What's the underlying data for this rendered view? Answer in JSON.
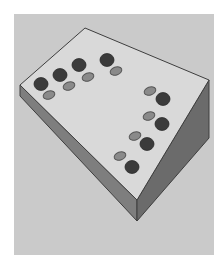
{
  "figure": {
    "colors": {
      "page_background": "#ffffff",
      "panel_background": "#cacaca",
      "top_face": "#d9d9d9",
      "left_face": "#7e7e7e",
      "right_face": "#6b6b6b",
      "edge_line": "#3e3e3e",
      "dark_disc": "#3b3b3b",
      "light_disc": "#8a8a8a",
      "light_disc_outline": "#555555"
    },
    "slab": {
      "top_face_points": "85,28 209,80 137,200 20,85",
      "left_face_points": "20,85 137,200 137,221 20,96",
      "right_face_points": "137,200 209,80 209,138 137,221"
    },
    "disc_pairs": [
      {
        "group": "top-row",
        "dark": {
          "cx": 41,
          "cy": 84,
          "r": 7
        },
        "light": {
          "cx": 49,
          "cy": 95,
          "rx": 6,
          "ry": 4
        }
      },
      {
        "group": "top-row",
        "dark": {
          "cx": 60,
          "cy": 75,
          "r": 7
        },
        "light": {
          "cx": 69,
          "cy": 86,
          "rx": 6,
          "ry": 4
        }
      },
      {
        "group": "top-row",
        "dark": {
          "cx": 79,
          "cy": 65,
          "r": 7
        },
        "light": {
          "cx": 88,
          "cy": 77,
          "rx": 6,
          "ry": 4
        }
      },
      {
        "group": "top-row",
        "dark": {
          "cx": 107,
          "cy": 60,
          "r": 7
        },
        "light": {
          "cx": 116,
          "cy": 71,
          "rx": 6,
          "ry": 4
        }
      },
      {
        "group": "right-column",
        "dark": {
          "cx": 163,
          "cy": 99,
          "r": 7
        },
        "light": {
          "cx": 150,
          "cy": 91,
          "rx": 6,
          "ry": 4
        }
      },
      {
        "group": "right-column",
        "dark": {
          "cx": 162,
          "cy": 124,
          "r": 7
        },
        "light": {
          "cx": 149,
          "cy": 116,
          "rx": 6,
          "ry": 4
        }
      },
      {
        "group": "right-column",
        "dark": {
          "cx": 147,
          "cy": 144,
          "r": 7
        },
        "light": {
          "cx": 135,
          "cy": 136,
          "rx": 6,
          "ry": 4
        }
      },
      {
        "group": "right-column",
        "dark": {
          "cx": 132,
          "cy": 167,
          "r": 7
        },
        "light": {
          "cx": 120,
          "cy": 156,
          "rx": 6,
          "ry": 4
        }
      }
    ]
  }
}
